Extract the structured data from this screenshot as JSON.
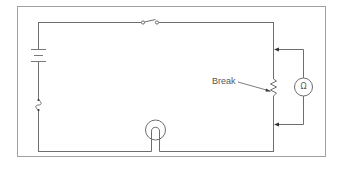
{
  "diagram": {
    "type": "electrical-circuit",
    "title": "",
    "colors": {
      "frame": "#a0a0a0",
      "wire": "#6e6e6e",
      "text": "#555555",
      "background": "#ffffff"
    },
    "components": [
      {
        "id": "battery",
        "kind": "battery",
        "position": "left wire, upper"
      },
      {
        "id": "fuse",
        "kind": "fuse",
        "position": "left wire, lower"
      },
      {
        "id": "switch",
        "kind": "switch (open)",
        "position": "top wire, center"
      },
      {
        "id": "lamp",
        "kind": "lamp",
        "position": "bottom wire, center"
      },
      {
        "id": "resistor",
        "kind": "resistor / load",
        "position": "right wire, middle"
      },
      {
        "id": "ohmmeter",
        "kind": "ohmmeter",
        "symbol": "Ω",
        "position": "right of circuit, connected across resistor"
      }
    ],
    "annotations": {
      "break_label": "Break",
      "ohm_symbol": "Ω"
    }
  }
}
